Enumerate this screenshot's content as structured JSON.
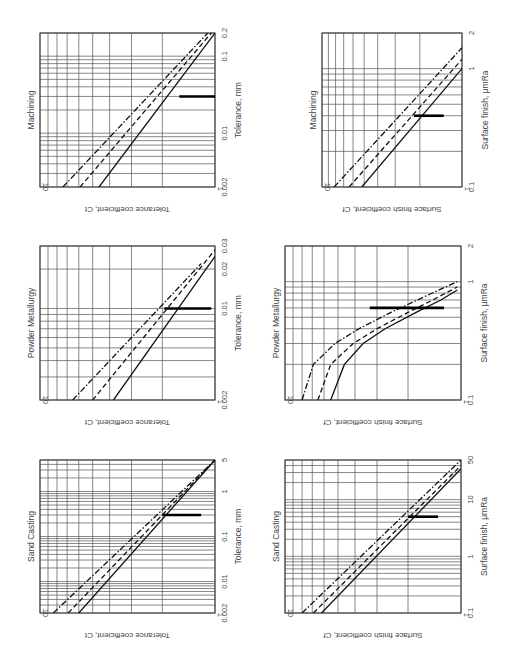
{
  "figure": {
    "orientation": "rotated 90 degrees clockwise",
    "legend_styles": [
      "solid",
      "dashed",
      "dash-dot"
    ]
  },
  "chart_data": [
    {
      "id": "machining-tolerance",
      "type": "line",
      "title": "Machining",
      "xlabel": "Tolerance, mm",
      "ylabel": "Tolerance coefficient, Ct",
      "xscale": "log",
      "yscale": "log",
      "xlim": [
        0.002,
        0.2
      ],
      "ylim": [
        1,
        10
      ],
      "xticks": [
        "0.002",
        "0.01",
        "0.1",
        "0.2"
      ],
      "yticks": [
        "1",
        "10"
      ],
      "marker_x": 0.03,
      "marker_y_span": [
        1.0,
        1.6
      ],
      "series": [
        {
          "name": "solid",
          "style": "solid",
          "points": [
            [
              0.002,
              4.6
            ],
            [
              0.2,
              1.0
            ]
          ]
        },
        {
          "name": "dashed",
          "style": "dashed",
          "points": [
            [
              0.002,
              5.9
            ],
            [
              0.2,
              1.05
            ]
          ]
        },
        {
          "name": "dash-dot",
          "style": "dashdot",
          "points": [
            [
              0.002,
              7.4
            ],
            [
              0.2,
              1.1
            ]
          ]
        }
      ]
    },
    {
      "id": "machining-surface-finish",
      "type": "line",
      "title": "Machining",
      "xlabel": "Surface finish, μmRa",
      "ylabel": "Surface finish coefficient, Cf",
      "xscale": "log",
      "yscale": "log",
      "xlim": [
        0.1,
        2
      ],
      "ylim": [
        1,
        10
      ],
      "xticks": [
        "0.1",
        "1",
        "2"
      ],
      "yticks": [
        "1",
        "10"
      ],
      "marker_x": 0.4,
      "marker_y_span": [
        1.35,
        2.2
      ],
      "series": [
        {
          "name": "solid",
          "style": "solid",
          "points": [
            [
              0.1,
              5.2
            ],
            [
              1.0,
              1.0
            ]
          ]
        },
        {
          "name": "dashed",
          "style": "dashed",
          "points": [
            [
              0.1,
              6.4
            ],
            [
              1.2,
              1.0
            ]
          ]
        },
        {
          "name": "dash-dot",
          "style": "dashdot",
          "points": [
            [
              0.1,
              8.2
            ],
            [
              1.5,
              1.0
            ]
          ]
        }
      ]
    },
    {
      "id": "powder-metallurgy-tolerance",
      "type": "line",
      "title": "Powder Metallurgy",
      "xlabel": "Tolerance, mm",
      "ylabel": "Tolerance coefficient, Ct",
      "xscale": "log",
      "yscale": "log",
      "xlim": [
        0.002,
        0.03
      ],
      "ylim": [
        1,
        10
      ],
      "xticks": [
        "0.002",
        "0.01",
        "0.02",
        "0.03"
      ],
      "yticks": [
        "1",
        "10"
      ],
      "marker_x": 0.01,
      "marker_y_span": [
        1.05,
        1.95
      ],
      "series": [
        {
          "name": "solid",
          "style": "solid",
          "points": [
            [
              0.002,
              3.8
            ],
            [
              0.025,
              1.0
            ]
          ]
        },
        {
          "name": "dashed",
          "style": "dashed",
          "points": [
            [
              0.002,
              5.0
            ],
            [
              0.028,
              1.0
            ]
          ]
        },
        {
          "name": "dash-dot",
          "style": "dashdot",
          "points": [
            [
              0.002,
              6.5
            ],
            [
              0.022,
              1.2
            ]
          ]
        }
      ]
    },
    {
      "id": "powder-metallurgy-surface-finish",
      "type": "line",
      "title": "Powder Metallurgy",
      "xlabel": "Surface finish, μmRa",
      "ylabel": "Surface finish coefficient, Cf",
      "xscale": "log",
      "yscale": "log",
      "xlim": [
        0.1,
        2
      ],
      "ylim": [
        1,
        10
      ],
      "xticks": [
        "0.1",
        "1",
        "2"
      ],
      "yticks": [
        "1",
        "10"
      ],
      "marker_x": 0.6,
      "marker_y_span": [
        1.25,
        3.3
      ],
      "series": [
        {
          "name": "solid",
          "style": "solid",
          "points": [
            [
              0.1,
              5.5
            ],
            [
              0.2,
              4.6
            ],
            [
              0.3,
              3.6
            ],
            [
              0.4,
              2.7
            ],
            [
              0.55,
              1.8
            ],
            [
              0.7,
              1.3
            ],
            [
              0.85,
              1.05
            ]
          ]
        },
        {
          "name": "dashed",
          "style": "dashed",
          "points": [
            [
              0.1,
              6.5
            ],
            [
              0.2,
              5.5
            ],
            [
              0.3,
              4.1
            ],
            [
              0.4,
              3.0
            ],
            [
              0.55,
              2.0
            ],
            [
              0.7,
              1.45
            ],
            [
              0.9,
              1.05
            ]
          ]
        },
        {
          "name": "dash-dot",
          "style": "dashdot",
          "points": [
            [
              0.1,
              8.0
            ],
            [
              0.2,
              6.9
            ],
            [
              0.3,
              5.2
            ],
            [
              0.4,
              3.8
            ],
            [
              0.55,
              2.5
            ],
            [
              0.75,
              1.6
            ],
            [
              1.0,
              1.05
            ]
          ]
        }
      ]
    },
    {
      "id": "sand-casting-tolerance",
      "type": "line",
      "title": "Sand Casting",
      "xlabel": "Tolerance, mm",
      "ylabel": "Tolerance coefficient, Ct",
      "xscale": "log",
      "yscale": "log",
      "xlim": [
        0.002,
        5
      ],
      "ylim": [
        1,
        10
      ],
      "xticks": [
        "0.002",
        "0.01",
        "0.1",
        "1",
        "5"
      ],
      "yticks": [
        "1",
        "10"
      ],
      "marker_x": 0.3,
      "marker_y_span": [
        1.2,
        2.0
      ],
      "series": [
        {
          "name": "solid",
          "style": "solid",
          "points": [
            [
              0.002,
              6.0
            ],
            [
              5,
              1.0
            ]
          ]
        },
        {
          "name": "dashed",
          "style": "dashed",
          "points": [
            [
              0.002,
              6.9
            ],
            [
              5,
              1.0
            ]
          ]
        },
        {
          "name": "dash-dot",
          "style": "dashdot",
          "points": [
            [
              0.002,
              8.4
            ],
            [
              5,
              1.0
            ]
          ]
        }
      ]
    },
    {
      "id": "sand-casting-surface-finish",
      "type": "line",
      "title": "Sand Casting",
      "xlabel": "Surface finish, μmRa",
      "ylabel": "Surface finish coefficient, Cf",
      "xscale": "log",
      "yscale": "log",
      "xlim": [
        0.1,
        50
      ],
      "ylim": [
        1,
        10
      ],
      "xticks": [
        "0.1",
        "1",
        "10",
        "50"
      ],
      "yticks": [
        "1",
        "10"
      ],
      "marker_x": 5,
      "marker_y_span": [
        1.35,
        2.0
      ],
      "series": [
        {
          "name": "solid",
          "style": "solid",
          "points": [
            [
              0.1,
              6.2
            ],
            [
              35,
              1.0
            ]
          ]
        },
        {
          "name": "dashed",
          "style": "dashed",
          "points": [
            [
              0.1,
              6.9
            ],
            [
              40,
              1.0
            ]
          ]
        },
        {
          "name": "dash-dot",
          "style": "dashdot",
          "points": [
            [
              0.1,
              8.0
            ],
            [
              50,
              1.0
            ]
          ]
        }
      ]
    }
  ]
}
